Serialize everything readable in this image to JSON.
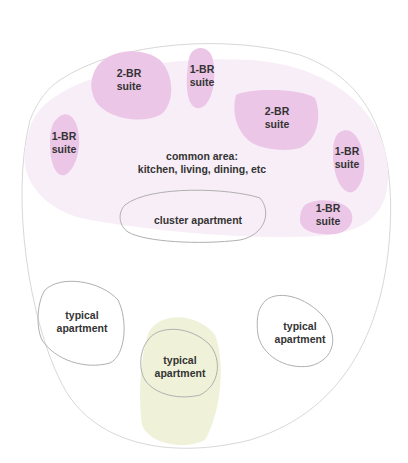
{
  "diagram": {
    "title": "",
    "colors": {
      "outline": "#d8d8d8",
      "common_area_fill": "#f8eef7",
      "suite_fill": "#ecc6e6",
      "highlight_fill": "#eff2d8",
      "shape_stroke": "#b0b0b0",
      "text": "#333333"
    },
    "common_area": {
      "line1": "common area:",
      "line2": "kitchen, living, dining, etc"
    },
    "cluster_apartment": {
      "label": "cluster apartment"
    },
    "suites": [
      {
        "line1": "2-BR",
        "line2": "suite"
      },
      {
        "line1": "1-BR",
        "line2": "suite"
      },
      {
        "line1": "2-BR",
        "line2": "suite"
      },
      {
        "line1": "1-BR",
        "line2": "suite"
      },
      {
        "line1": "1-BR",
        "line2": "suite"
      },
      {
        "line1": "1-BR",
        "line2": "suite"
      }
    ],
    "typical_apartments": [
      {
        "line1": "typical",
        "line2": "apartment"
      },
      {
        "line1": "typical",
        "line2": "apartment"
      },
      {
        "line1": "typical",
        "line2": "apartment"
      }
    ]
  }
}
